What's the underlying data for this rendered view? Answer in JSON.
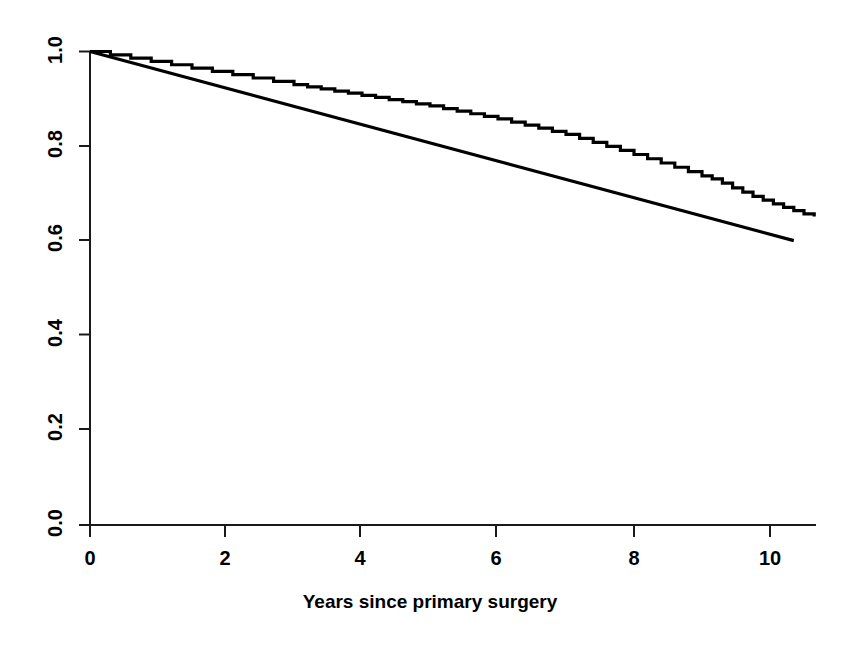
{
  "chart_data": {
    "type": "line",
    "title": "",
    "subtitle": "",
    "xlabel": "Years since primary surgery",
    "ylabel": "",
    "xlim": [
      -0.35,
      10.7
    ],
    "ylim": [
      0.0,
      1.0
    ],
    "grid": false,
    "legend": "none",
    "x_ticks": [
      0,
      2,
      4,
      6,
      8,
      10
    ],
    "x_tick_labels": [
      "0",
      "2",
      "4",
      "6",
      "8",
      "10"
    ],
    "y_ticks": [
      0.0,
      0.2,
      0.4,
      0.6,
      0.8,
      1.0
    ],
    "y_tick_labels": [
      "0.0",
      "0.2",
      "0.4",
      "0.6",
      "0.8",
      "1.0"
    ],
    "series": [
      {
        "name": "Kaplan-Meier survival estimate",
        "style": "step",
        "color": "#000000",
        "x": [
          0.0,
          0.3,
          0.6,
          0.9,
          1.2,
          1.5,
          1.8,
          2.1,
          2.4,
          2.7,
          3.0,
          3.2,
          3.4,
          3.6,
          3.8,
          4.0,
          4.2,
          4.4,
          4.6,
          4.8,
          5.0,
          5.2,
          5.4,
          5.6,
          5.8,
          6.0,
          6.2,
          6.4,
          6.6,
          6.8,
          7.0,
          7.2,
          7.4,
          7.6,
          7.8,
          8.0,
          8.2,
          8.4,
          8.6,
          8.8,
          9.0,
          9.15,
          9.3,
          9.45,
          9.6,
          9.75,
          9.9,
          10.05,
          10.2,
          10.35,
          10.5,
          10.65
        ],
        "y": [
          1.0,
          0.993,
          0.986,
          0.979,
          0.972,
          0.965,
          0.958,
          0.951,
          0.944,
          0.937,
          0.93,
          0.9255,
          0.921,
          0.9165,
          0.912,
          0.9075,
          0.903,
          0.8985,
          0.894,
          0.8895,
          0.885,
          0.8795,
          0.874,
          0.8685,
          0.863,
          0.8575,
          0.851,
          0.8445,
          0.838,
          0.8315,
          0.825,
          0.8165,
          0.808,
          0.7995,
          0.791,
          0.7825,
          0.7735,
          0.7645,
          0.7555,
          0.7465,
          0.7375,
          0.731,
          0.722,
          0.712,
          0.703,
          0.694,
          0.686,
          0.678,
          0.671,
          0.664,
          0.657,
          0.6515
        ]
      },
      {
        "name": "Expected survival (general population)",
        "style": "straight",
        "color": "#000000",
        "x": [
          0.0,
          10.35
        ],
        "y": [
          1.0,
          0.6005
        ]
      }
    ]
  },
  "axis": {
    "x_title": "Years since primary surgery"
  }
}
